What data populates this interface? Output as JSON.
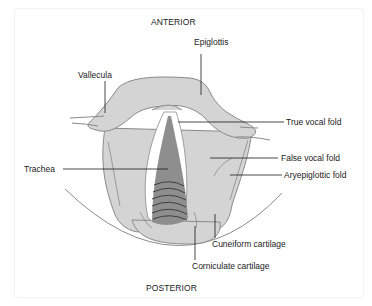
{
  "diagram": {
    "orientation": {
      "top": "ANTERIOR",
      "bottom": "POSTERIOR"
    },
    "labels": {
      "epiglottis": "Epiglottis",
      "vallecula": "Vallecula",
      "true_vocal_fold": "True vocal fold",
      "false_vocal_fold": "False vocal fold",
      "aryepiglottic_fold": "Aryepiglottic fold",
      "trachea": "Trachea",
      "cuneiform_cartilage": "Cuneiform cartilage",
      "corniculate_cartilage": "Corniculate cartilage"
    },
    "colors": {
      "tissue": "#d4d4d4",
      "tissue_outline": "#8a8a8a",
      "trachea": "#8e8e8e",
      "trachea_rings": "#3f3f3f",
      "glottis_gap": "#ffffff",
      "leader_line": "#1a1a1a"
    }
  }
}
